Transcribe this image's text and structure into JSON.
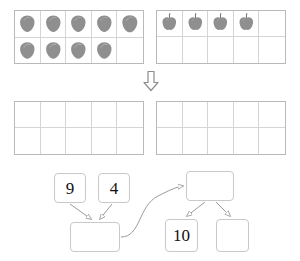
{
  "worksheet": {
    "title": "Make-a-ten number bond worksheet",
    "ink_color": "#b9b9b9",
    "fruit_color": "#8c8c8c"
  },
  "ten_frames": [
    {
      "name": "strawberries-ten-frame",
      "item_icon": "strawberry-icon",
      "item_label": "strawberry",
      "filled_count": 9,
      "total_cells": 10,
      "columns": 5,
      "rows": 2
    },
    {
      "name": "apples-ten-frame",
      "item_icon": "apple-icon",
      "item_label": "apple",
      "filled_count": 4,
      "total_cells": 10,
      "columns": 5,
      "rows": 2
    },
    {
      "name": "empty-ten-frame-left",
      "item_icon": "",
      "item_label": "",
      "filled_count": 0,
      "total_cells": 10,
      "columns": 5,
      "rows": 2
    },
    {
      "name": "empty-ten-frame-right",
      "item_icon": "",
      "item_label": "",
      "filled_count": 0,
      "total_cells": 10,
      "columns": 5,
      "rows": 2
    }
  ],
  "divider": {
    "icon": "down-arrow-icon",
    "glyph": "⇩"
  },
  "bond_diagram": {
    "boxes": {
      "nine": "9",
      "four": "4",
      "sum": "",
      "top_right": "",
      "ten": "10",
      "blank_right": ""
    },
    "connectors": [
      {
        "name": "nine-to-sum",
        "icon": "arrow-icon"
      },
      {
        "name": "four-to-sum",
        "icon": "arrow-icon"
      },
      {
        "name": "sum-to-top-right",
        "icon": "curved-arrow-icon"
      },
      {
        "name": "top-right-to-ten",
        "icon": "arrow-icon"
      },
      {
        "name": "top-right-to-blank",
        "icon": "arrow-icon"
      }
    ]
  }
}
